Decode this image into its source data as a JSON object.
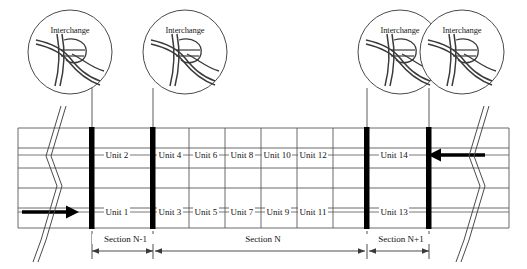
{
  "diagram": {
    "colors": {
      "line": "#4a4a4a",
      "heavy": "#000000",
      "text": "#111111",
      "background": "#ffffff"
    },
    "callouts": [
      {
        "label": "Interchange",
        "icon": "interchange-icon",
        "cx": 70,
        "cy": 52,
        "r": 42,
        "leader_x": 92,
        "leader_y1": 88,
        "leader_y2": 128
      },
      {
        "label": "Interchange",
        "icon": "interchange-icon",
        "cx": 185,
        "cy": 52,
        "r": 42,
        "leader_x": 153,
        "leader_y1": 88,
        "leader_y2": 128
      },
      {
        "label": "Interchange",
        "icon": "interchange-icon",
        "cx": 400,
        "cy": 52,
        "r": 42,
        "leader_x": 367,
        "leader_y1": 88,
        "leader_y2": 128
      },
      {
        "label": "Interchange",
        "icon": "interchange-icon",
        "cx": 462,
        "cy": 52,
        "r": 42,
        "leader_x": 429,
        "leader_y1": 88,
        "leader_y2": 128
      }
    ],
    "grid": {
      "left": 18,
      "right": 509,
      "top": 128,
      "bottom": 228,
      "lane_count": 5,
      "lane_lines_y": [
        128,
        148,
        168,
        188,
        208,
        228
      ],
      "upper_label_row_y": 155,
      "lower_label_row_y": 212,
      "cell_dividers_x": [
        92,
        153,
        189,
        225,
        261,
        297,
        333,
        367,
        429
      ],
      "heavy_dividers_x": [
        92,
        153,
        367,
        429
      ]
    },
    "units": {
      "upper_row_name": "upper-carriageway",
      "lower_row_name": "lower-carriageway",
      "upper": [
        {
          "label": "Unit 2",
          "x": 122
        },
        {
          "label": "Unit 4",
          "x": 171
        },
        {
          "label": "Unit 6",
          "x": 207
        },
        {
          "label": "Unit 8",
          "x": 243
        },
        {
          "label": "Unit 10",
          "x": 279
        },
        {
          "label": "Unit 12",
          "x": 315
        },
        {
          "label": "Unit 14",
          "x": 350
        }
      ],
      "lower": [
        {
          "label": "Unit 1",
          "x": 122
        },
        {
          "label": "Unit 3",
          "x": 171
        },
        {
          "label": "Unit 5",
          "x": 207
        },
        {
          "label": "Unit 7",
          "x": 243
        },
        {
          "label": "Unit 9",
          "x": 279
        },
        {
          "label": "Unit 11",
          "x": 315
        },
        {
          "label": "Unit 13",
          "x": 350
        }
      ]
    },
    "sections": [
      {
        "label": "Section N-1",
        "x1": 92,
        "x2": 153,
        "center": 122
      },
      {
        "label": "Section N",
        "x1": 153,
        "x2": 367,
        "center": 260
      },
      {
        "label": "Section N+1",
        "x1": 367,
        "x2": 429,
        "center": 398
      }
    ],
    "section_axis_y": 251,
    "section_label_y": 239,
    "arrows": [
      {
        "name": "flow-arrow-eastbound",
        "direction": "right",
        "x1": 22,
        "x2": 73,
        "y": 212
      },
      {
        "name": "flow-arrow-westbound",
        "direction": "left",
        "x1": 485,
        "x2": 434,
        "y": 155
      }
    ],
    "break_symbols": [
      {
        "name": "break-symbol-left",
        "x": 45
      },
      {
        "name": "break-symbol-right",
        "x": 468
      }
    ]
  }
}
